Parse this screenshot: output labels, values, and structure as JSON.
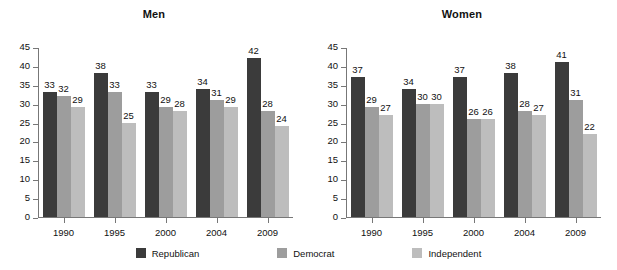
{
  "chart_data": [
    {
      "type": "bar",
      "title": "Men",
      "xlabel": "",
      "ylabel": "",
      "ylim": [
        0,
        45
      ],
      "yticks": [
        0,
        5,
        10,
        15,
        20,
        25,
        30,
        35,
        40,
        45
      ],
      "grid": false,
      "legend_position": "bottom",
      "categories": [
        "1990",
        "1995",
        "2000",
        "2004",
        "2009"
      ],
      "series": [
        {
          "name": "Republican",
          "color": "#3b3b3b",
          "values": [
            33,
            38,
            33,
            34,
            42
          ]
        },
        {
          "name": "Democrat",
          "color": "#9d9d9d",
          "values": [
            32,
            33,
            29,
            31,
            28
          ]
        },
        {
          "name": "Independent",
          "color": "#bdbdbd",
          "values": [
            29,
            25,
            28,
            29,
            24
          ]
        }
      ]
    },
    {
      "type": "bar",
      "title": "Women",
      "xlabel": "",
      "ylabel": "",
      "ylim": [
        0,
        45
      ],
      "yticks": [
        0,
        5,
        10,
        15,
        20,
        25,
        30,
        35,
        40,
        45
      ],
      "grid": false,
      "legend_position": "bottom",
      "categories": [
        "1990",
        "1995",
        "2000",
        "2004",
        "2009"
      ],
      "series": [
        {
          "name": "Republican",
          "color": "#3b3b3b",
          "values": [
            37,
            34,
            37,
            38,
            41
          ]
        },
        {
          "name": "Democrat",
          "color": "#9d9d9d",
          "values": [
            29,
            30,
            26,
            28,
            31
          ]
        },
        {
          "name": "Independent",
          "color": "#bdbdbd",
          "values": [
            27,
            30,
            26,
            27,
            22
          ]
        }
      ]
    }
  ],
  "legend": {
    "items": [
      {
        "label": "Republican",
        "color": "#3b3b3b"
      },
      {
        "label": "Democrat",
        "color": "#9d9d9d"
      },
      {
        "label": "Independent",
        "color": "#bdbdbd"
      }
    ]
  }
}
